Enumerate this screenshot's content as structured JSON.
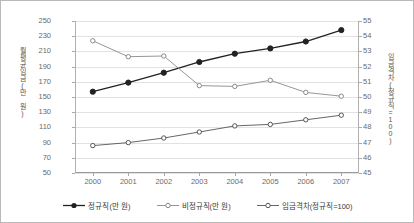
{
  "chart_data": {
    "type": "line",
    "title": "",
    "xlabel": "",
    "categories": [
      "2000",
      "2001",
      "2002",
      "2003",
      "2004",
      "2005",
      "2006",
      "2007"
    ],
    "ylabel_left": "월평균임금(만 원)",
    "ylabel_right": "임금격차(정규직=100)",
    "ylim_left": [
      50,
      250
    ],
    "ylim_right": [
      45,
      55
    ],
    "ytick_step_left": 20,
    "ytick_step_right": 1,
    "yticks_left": [
      "250",
      "230",
      "210",
      "190",
      "170",
      "150",
      "130",
      "110",
      "90",
      "70",
      "50"
    ],
    "yticks_right": [
      "55",
      "54",
      "53",
      "52",
      "51",
      "50",
      "49",
      "48",
      "47",
      "46",
      "45"
    ],
    "grid": true,
    "legend_position": "bottom",
    "series": [
      {
        "name": "정규직(만 원)",
        "axis": "left",
        "marker": "filled-circle",
        "color": "#222222",
        "values": [
          157,
          169,
          182,
          196,
          207,
          214,
          223,
          238
        ]
      },
      {
        "name": "비정규직(만 원)",
        "axis": "left",
        "marker": "open-circle",
        "color": "#8a8a8a",
        "values": [
          224,
          203,
          204,
          165,
          164,
          172,
          156,
          151
        ]
      },
      {
        "name": "임금격차(정규직=100)",
        "axis": "right",
        "marker": "open-circle",
        "color": "#555555",
        "values": [
          46.8,
          47.0,
          47.3,
          47.7,
          48.1,
          48.2,
          48.5,
          48.8
        ]
      }
    ]
  }
}
